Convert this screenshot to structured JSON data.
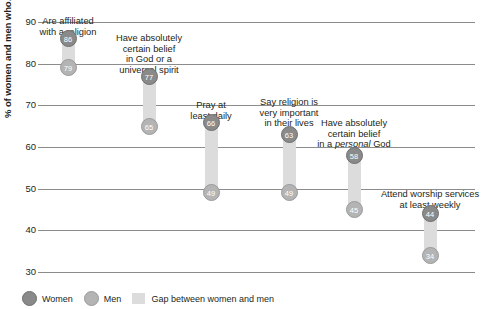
{
  "chart_data": {
    "type": "bar",
    "subtype": "dumbbell-gap",
    "title": "",
    "xlabel": "",
    "ylabel": "% of women and men who…",
    "ylim": [
      30,
      90
    ],
    "yticks": [
      90,
      80,
      70,
      60,
      50,
      40,
      30
    ],
    "grid": true,
    "legend_position": "bottom-left",
    "categories": [
      "Are affiliated\nwith a religion",
      "Have absolutely\ncertain belief\nin God or a\nuniversal spirit",
      "Pray at\nleast daily",
      "Say religion is\nvery important\nin their lives",
      "Have absolutely\ncertain belief\nin a personal God",
      "Attend worship services\nat least weekly"
    ],
    "series": [
      {
        "name": "Women",
        "values": [
          86,
          77,
          66,
          63,
          58,
          44
        ],
        "color": "#8a8a8a"
      },
      {
        "name": "Men",
        "values": [
          79,
          65,
          49,
          49,
          45,
          34
        ],
        "color": "#b4b4b4"
      }
    ],
    "gap_values": [
      7,
      12,
      17,
      14,
      13,
      10
    ],
    "gap_color": "#dcdcdc"
  },
  "axis": {
    "y_title": "% of women and men who…",
    "ticks": [
      "90",
      "80",
      "70",
      "60",
      "50",
      "40",
      "30"
    ]
  },
  "groups": [
    {
      "label_html": "Are affiliated<br>with a religion",
      "women": "86",
      "men": "79"
    },
    {
      "label_html": "Have absolutely<br>certain belief<br>in God or a<br>universal spirit",
      "women": "77",
      "men": "65"
    },
    {
      "label_html": "Pray at<br>least daily",
      "women": "66",
      "men": "49"
    },
    {
      "label_html": "Say religion is<br>very important<br>in their lives",
      "women": "63",
      "men": "49"
    },
    {
      "label_html": "Have absolutely<br>certain belief<br>in a <em>personal</em> God",
      "women": "58",
      "men": "45"
    },
    {
      "label_html": "Attend worship services<br>at least weekly",
      "women": "44",
      "men": "34"
    }
  ],
  "legend": {
    "women_label": "Women",
    "men_label": "Men",
    "gap_label": "Gap between women and men"
  }
}
